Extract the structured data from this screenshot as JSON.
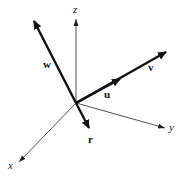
{
  "diagram": {
    "origin": [
      76,
      103
    ],
    "axes": [
      {
        "name": "z",
        "label": "z",
        "tip": [
          76,
          18
        ],
        "label_pos": [
          73,
          13
        ]
      },
      {
        "name": "y",
        "label": "y",
        "tip": [
          166,
          128
        ],
        "label_pos": [
          169,
          131
        ]
      },
      {
        "name": "x",
        "label": "x",
        "tip": [
          18,
          163
        ],
        "label_pos": [
          8,
          169
        ]
      }
    ],
    "vectors": [
      {
        "name": "w",
        "label": "w",
        "tip": [
          33,
          19
        ],
        "label_pos": [
          44,
          68
        ]
      },
      {
        "name": "v",
        "label": "v",
        "tip": [
          168,
          51
        ],
        "label_pos": [
          148,
          71
        ]
      },
      {
        "name": "u",
        "label": "u",
        "tip": [
          121,
          78
        ],
        "label_pos": [
          104,
          97
        ]
      },
      {
        "name": "r",
        "label": "r",
        "tip": [
          90,
          130
        ],
        "label_pos": [
          88,
          143
        ]
      }
    ],
    "colors": {
      "axis": "#222222",
      "vector": "#111111",
      "background": "#ffffff"
    }
  }
}
